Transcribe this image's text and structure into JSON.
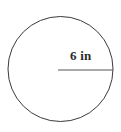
{
  "figure": {
    "name": "circle-with-radius",
    "background_color": "#ffffff",
    "stroke_color": "#3a3a3a",
    "label_color": "#2b2b2b",
    "width": 121,
    "height": 132,
    "circle": {
      "center_x": 60.5,
      "center_y": 69,
      "radius_px": 52.5,
      "stroke_width": 1
    },
    "radius_segment": {
      "x1": 58,
      "y1": 70,
      "x2": 113,
      "y2": 70,
      "stroke_width": 1
    },
    "radius_label": {
      "text": "6 in",
      "value": 6,
      "unit": "in"
    }
  }
}
